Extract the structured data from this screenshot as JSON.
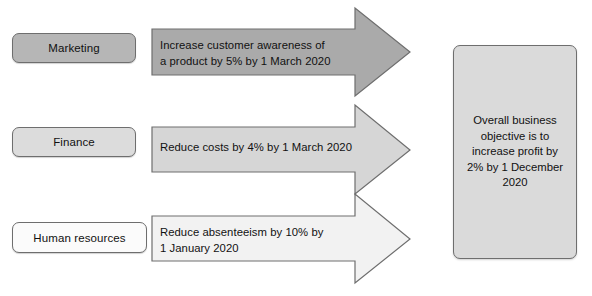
{
  "diagram": {
    "type": "business-objectives-cascade",
    "rows": [
      {
        "department": "Marketing",
        "objective": "Increase customer awareness of\na product by 5% by 1 March 2020",
        "arrow_fill": "#aaaaaa",
        "box_fill": "#b6b6b6"
      },
      {
        "department": "Finance",
        "objective": "Reduce costs by 4% by 1 March 2020",
        "arrow_fill": "#d6d6d6",
        "box_fill": "#dcdcdc"
      },
      {
        "department": "Human resources",
        "objective": "Reduce absenteeism by 10% by\n1 January 2020",
        "arrow_fill": "#f2f2f2",
        "box_fill": "#fbfbfb"
      }
    ],
    "overall": {
      "text": "Overall business\nobjective is to\nincrease profit by\n2% by 1 December\n2020",
      "fill": "#dadada"
    },
    "stroke_color": "#6e6e6e",
    "text_color": "#111111"
  }
}
